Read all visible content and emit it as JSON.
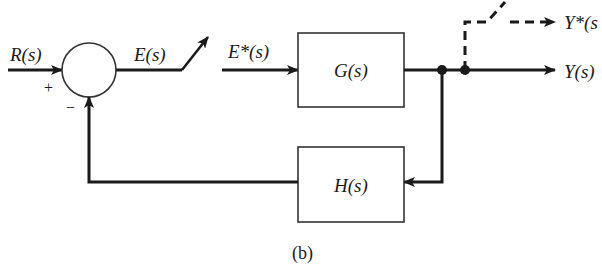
{
  "diagram": {
    "type": "sampled-data feedback control block diagram",
    "caption": "(b)",
    "signals": {
      "input": "R(s)",
      "error": "E(s)",
      "sampled_error": "E*(s)",
      "output": "Y(s)",
      "sampled_output": "Y*(s"
    },
    "blocks": {
      "forward": "G(s)",
      "feedback": "H(s)"
    },
    "summing_junction": {
      "plus_sign": "+",
      "minus_sign": "−"
    },
    "colors": {
      "line": "#1a1a1a",
      "background": "#ffffff"
    }
  }
}
